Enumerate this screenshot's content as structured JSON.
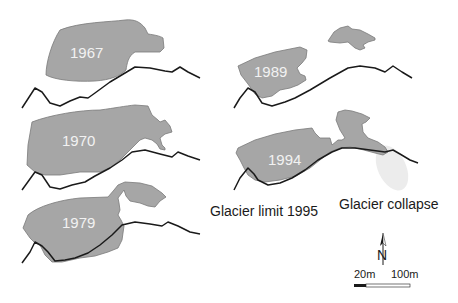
{
  "figure": {
    "panels": [
      {
        "year": "1967"
      },
      {
        "year": "1970"
      },
      {
        "year": "1979"
      },
      {
        "year": "1989"
      },
      {
        "year": "1994"
      }
    ],
    "labels": {
      "limit": "Glacier limit 1995",
      "collapse": "Glacier collapse"
    },
    "north_arrow": {
      "letter": "N"
    },
    "scale_bar": {
      "left_label": "20m",
      "right_label": "100m"
    },
    "colors": {
      "glacier_fill": "#a6a6a6",
      "limit_line": "#1a1a1a",
      "collapse_ghost": "#ececec"
    }
  }
}
